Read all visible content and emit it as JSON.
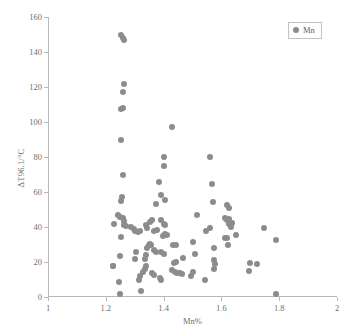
{
  "chart_data": {
    "type": "scatter",
    "title": "",
    "xlabel": "Mn%",
    "ylabel": "ΔT96.1/°C",
    "xlim": [
      1,
      2
    ],
    "ylim": [
      0,
      160
    ],
    "xticks": [
      "1",
      "1.2",
      "1.4",
      "1.6",
      "1.8",
      "2"
    ],
    "xtick_values": [
      1,
      1.2,
      1.4,
      1.6,
      1.8,
      2
    ],
    "yticks": [
      "0",
      "20",
      "40",
      "60",
      "80",
      "100",
      "120",
      "140",
      "160"
    ],
    "ytick_values": [
      0,
      20,
      40,
      60,
      80,
      100,
      120,
      140,
      160
    ],
    "grid": false,
    "legend_position": "top-right",
    "marker_color": "#8c8c8c",
    "axis_color": "#b9b9b9",
    "series": [
      {
        "name": "Mn",
        "points": [
          [
            1.252,
            149.5
          ],
          [
            1.258,
            148.0
          ],
          [
            1.262,
            147.0
          ],
          [
            1.262,
            122.0
          ],
          [
            1.258,
            117.0
          ],
          [
            1.252,
            107.5
          ],
          [
            1.258,
            108.0
          ],
          [
            1.252,
            89.5
          ],
          [
            1.258,
            69.5
          ],
          [
            1.256,
            57.0
          ],
          [
            1.254,
            55.0
          ],
          [
            1.242,
            47.0
          ],
          [
            1.248,
            45.5
          ],
          [
            1.258,
            45.0
          ],
          [
            1.262,
            43.5
          ],
          [
            1.228,
            41.5
          ],
          [
            1.262,
            41.0
          ],
          [
            1.27,
            40.5
          ],
          [
            1.254,
            34.5
          ],
          [
            1.248,
            23.5
          ],
          [
            1.224,
            18.0
          ],
          [
            1.226,
            17.5
          ],
          [
            1.246,
            8.5
          ],
          [
            1.25,
            2.0
          ],
          [
            1.286,
            40.0
          ],
          [
            1.296,
            39.0
          ],
          [
            1.3,
            38.0
          ],
          [
            1.3,
            22.0
          ],
          [
            1.306,
            25.5
          ],
          [
            1.31,
            37.0
          ],
          [
            1.318,
            38.0
          ],
          [
            1.322,
            3.5
          ],
          [
            1.316,
            10.0
          ],
          [
            1.32,
            12.0
          ],
          [
            1.33,
            14.5
          ],
          [
            1.334,
            16.0
          ],
          [
            1.338,
            17.5
          ],
          [
            1.334,
            22.0
          ],
          [
            1.34,
            24.0
          ],
          [
            1.344,
            28.0
          ],
          [
            1.348,
            30.0
          ],
          [
            1.352,
            30.5
          ],
          [
            1.356,
            29.5
          ],
          [
            1.338,
            41.0
          ],
          [
            1.344,
            39.5
          ],
          [
            1.352,
            43.0
          ],
          [
            1.36,
            44.0
          ],
          [
            1.368,
            38.0
          ],
          [
            1.376,
            38.5
          ],
          [
            1.372,
            53.0
          ],
          [
            1.368,
            27.0
          ],
          [
            1.372,
            25.5
          ],
          [
            1.36,
            13.5
          ],
          [
            1.366,
            12.5
          ],
          [
            1.384,
            65.5
          ],
          [
            1.392,
            58.5
          ],
          [
            1.4,
            80.0
          ],
          [
            1.402,
            75.0
          ],
          [
            1.406,
            55.5
          ],
          [
            1.392,
            44.0
          ],
          [
            1.4,
            42.0
          ],
          [
            1.406,
            41.0
          ],
          [
            1.398,
            35.0
          ],
          [
            1.406,
            36.0
          ],
          [
            1.412,
            35.5
          ],
          [
            1.392,
            26.0
          ],
          [
            1.4,
            24.5
          ],
          [
            1.386,
            11.0
          ],
          [
            1.392,
            10.0
          ],
          [
            1.428,
            97.0
          ],
          [
            1.434,
            30.0
          ],
          [
            1.442,
            29.5
          ],
          [
            1.436,
            19.5
          ],
          [
            1.444,
            20.0
          ],
          [
            1.43,
            15.5
          ],
          [
            1.438,
            14.5
          ],
          [
            1.446,
            14.0
          ],
          [
            1.456,
            14.0
          ],
          [
            1.464,
            13.0
          ],
          [
            1.466,
            22.5
          ],
          [
            1.494,
            12.0
          ],
          [
            1.5,
            14.5
          ],
          [
            1.5,
            31.5
          ],
          [
            1.508,
            24.5
          ],
          [
            1.516,
            47.0
          ],
          [
            1.56,
            80.0
          ],
          [
            1.566,
            64.5
          ],
          [
            1.57,
            54.5
          ],
          [
            1.56,
            39.5
          ],
          [
            1.548,
            38.0
          ],
          [
            1.574,
            28.0
          ],
          [
            1.576,
            21.0
          ],
          [
            1.578,
            19.0
          ],
          [
            1.574,
            16.0
          ],
          [
            1.544,
            10.0
          ],
          [
            1.62,
            52.5
          ],
          [
            1.626,
            51.0
          ],
          [
            1.612,
            45.0
          ],
          [
            1.62,
            44.0
          ],
          [
            1.628,
            44.5
          ],
          [
            1.636,
            42.5
          ],
          [
            1.626,
            41.5
          ],
          [
            1.634,
            40.0
          ],
          [
            1.612,
            34.0
          ],
          [
            1.62,
            33.5
          ],
          [
            1.624,
            30.0
          ],
          [
            1.652,
            35.5
          ],
          [
            1.7,
            19.5
          ],
          [
            1.694,
            15.0
          ],
          [
            1.722,
            19.0
          ],
          [
            1.748,
            39.5
          ],
          [
            1.79,
            32.5
          ],
          [
            1.788,
            2.0
          ]
        ]
      }
    ]
  },
  "legend": {
    "entries": [
      {
        "label": "Mn",
        "icon": "filled-circle-marker"
      }
    ]
  }
}
